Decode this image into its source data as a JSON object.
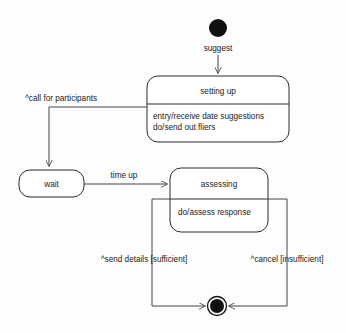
{
  "diagram": {
    "type": "state-machine",
    "background_color": "#fdfdfd",
    "line_color": "#444444",
    "node_color": "#111111"
  },
  "nodes": {
    "initial": {
      "name": "initial-state",
      "shape": "filled-circle"
    },
    "final": {
      "name": "final-state",
      "shape": "bullseye"
    },
    "setting_up": {
      "title": "setting up",
      "activities": [
        "entry/receive date suggestions",
        "do/send out fliers"
      ]
    },
    "wait": {
      "title": "wait",
      "activities": []
    },
    "assessing": {
      "title": "assessing",
      "activities": [
        "do/assess response"
      ]
    }
  },
  "transitions": {
    "suggest": "suggest",
    "call_for_participants": "^call for participants",
    "time_up": "time up",
    "send_details": "^send details [sufficient]",
    "cancel": "^cancel [insufficient]"
  }
}
